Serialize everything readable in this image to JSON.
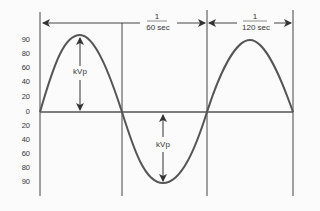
{
  "diagram": {
    "y_ticks_upper": [
      "90",
      "80",
      "60",
      "40",
      "20",
      "0"
    ],
    "y_ticks_lower": [
      "20",
      "40",
      "60",
      "80",
      "90"
    ],
    "intervals": [
      {
        "numerator": "1",
        "denominator": "60 sec"
      },
      {
        "numerator": "1",
        "denominator": "120 sec"
      }
    ],
    "peak_label_top": "kVp",
    "peak_label_bottom": "kVp",
    "colors": {
      "waveform": "#555555",
      "lines": "#333333",
      "background": "#fbfbfb"
    }
  }
}
